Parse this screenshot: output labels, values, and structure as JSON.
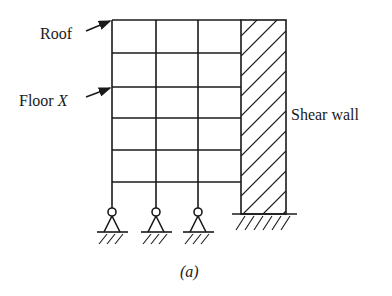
{
  "figure": {
    "caption": "(a)",
    "labels": {
      "roof": "Roof",
      "floor_prefix": "Floor ",
      "floor_var": "X",
      "shear_wall": "Shear wall"
    },
    "frame": {
      "bays": 3,
      "stories": 5,
      "column_x": [
        112,
        156,
        198,
        241
      ],
      "floor_y": [
        20,
        53,
        87,
        118,
        150,
        182
      ],
      "support_type": "pinned",
      "supports": 3
    },
    "wall": {
      "x": 241,
      "width": 45,
      "top": 20,
      "bottom": 214,
      "base": "fixed",
      "hatch": "diagonal"
    },
    "colors": {
      "line": "#1a1a1a",
      "background": "#ffffff"
    }
  }
}
